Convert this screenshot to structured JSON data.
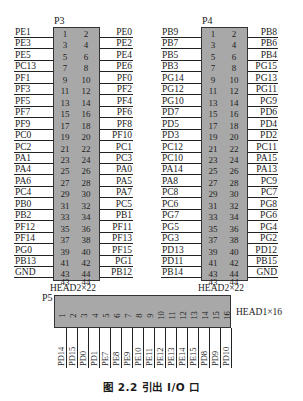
{
  "caption": "图 2.2  引出 I/O 口",
  "connectors": {
    "p3": {
      "ref": "P3",
      "type": "HEAD2×22",
      "left": [
        "PE1",
        "PE3",
        "PE5",
        "PC13",
        "PF1",
        "PF3",
        "PF5",
        "PF7",
        "PF9",
        "PC0",
        "PC2",
        "PA1",
        "PA4",
        "PA6",
        "PC4",
        "PB0",
        "PB2",
        "PF12",
        "PF14",
        "PG0",
        "PB13",
        "GND"
      ],
      "right": [
        "PE0",
        "PE2",
        "PE4",
        "PE6",
        "PF0",
        "PF2",
        "PF4",
        "PF6",
        "PF8",
        "PF10",
        "PC1",
        "PC3",
        "PA0",
        "PA5",
        "PA7",
        "PC5",
        "PB1",
        "PF11",
        "PF13",
        "PF15",
        "PG1",
        "PB12"
      ]
    },
    "p4": {
      "ref": "P4",
      "type": "HEAD2×22",
      "left": [
        "PB9",
        "PB7",
        "PB5",
        "PB3",
        "PG14",
        "PG12",
        "PG10",
        "PD7",
        "PD5",
        "PD3",
        "PC12",
        "PC10",
        "PA14",
        "PA8",
        "PC8",
        "PC6",
        "PG7",
        "PG5",
        "PG3",
        "PD13",
        "PD11",
        "PB14"
      ],
      "right": [
        "PB8",
        "PB6",
        "PB4",
        "PG15",
        "PG13",
        "PG11",
        "PG9",
        "PD6",
        "PD4",
        "PD2",
        "PC11",
        "PA15",
        "PA13",
        "PC9",
        "PC7",
        "PG8",
        "PG6",
        "PG4",
        "PG2",
        "PD12",
        "PB15",
        "GND"
      ]
    },
    "p5": {
      "ref": "P5",
      "type": "HEAD1×16",
      "pins": [
        "1",
        "2",
        "3",
        "4",
        "5",
        "6",
        "7",
        "8",
        "9",
        "10",
        "11",
        "12",
        "13",
        "14",
        "15",
        "16"
      ],
      "signals": [
        "PD14",
        "PD15",
        "PD0",
        "PD1",
        "PE7",
        "PE8",
        "PE9",
        "PE10",
        "PE11",
        "PE12",
        "PE13",
        "PE14",
        "PE15",
        "PD8",
        "PD9",
        "PD10"
      ]
    }
  }
}
